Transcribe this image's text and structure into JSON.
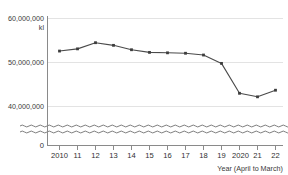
{
  "chart_data": {
    "type": "line",
    "title": "",
    "subtitle": "",
    "xlabel": "Year (April to March)",
    "ylabel": "",
    "unit": "kl",
    "categories": [
      "2010",
      "11",
      "12",
      "13",
      "14",
      "15",
      "16",
      "17",
      "18",
      "19",
      "2020",
      "21",
      "22"
    ],
    "values": [
      52600000,
      53100000,
      54500000,
      53900000,
      52900000,
      52300000,
      52200000,
      52100000,
      51700000,
      49800000,
      43000000,
      42200000,
      43700000
    ],
    "series": [
      {
        "name": "Volume",
        "values": [
          52600000,
          53100000,
          54500000,
          53900000,
          52900000,
          52300000,
          52200000,
          52100000,
          51700000,
          49800000,
          43000000,
          42200000,
          43700000
        ]
      }
    ],
    "ytick_labels": [
      "60,000,000",
      "50,000,000",
      "40,000,000",
      "0"
    ],
    "ytick_values": [
      60000000,
      50000000,
      40000000,
      0
    ],
    "ylim": [
      38000000,
      60000000
    ],
    "axis_break": true,
    "axis_break_between": [
      0,
      40000000
    ],
    "grid": true,
    "grid_axis": "y",
    "legend": false,
    "legend_position": "none",
    "line_color": "#4a4a4a",
    "marker_color": "#3d3d3d",
    "grid_color": "#e3e3e3",
    "axis_color": "#8a8a8a",
    "background_color": "#ffffff"
  },
  "axis": {
    "x_caption": "Year (April to March)",
    "y_unit": "kl",
    "zero_label": "0"
  }
}
